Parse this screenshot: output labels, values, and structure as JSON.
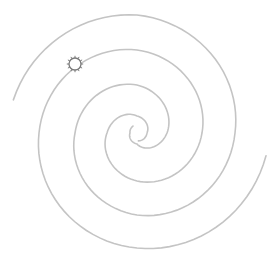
{
  "diagram": {
    "type": "double-arm spiral",
    "center": [
      137,
      133
    ],
    "stroke_color": "#c4c4c4",
    "marker_color": "#7a7a7a",
    "arms": [
      {
        "name": "arm-outer-right",
        "points_deg_r": [
          [
            10,
            131
          ],
          [
            90,
            115
          ],
          [
            180,
            98
          ],
          [
            270,
            83
          ],
          [
            360,
            65
          ],
          [
            450,
            48
          ],
          [
            540,
            30
          ],
          [
            630,
            17
          ],
          [
            720,
            10
          ],
          [
            800,
            8
          ]
        ]
      },
      {
        "name": "arm-outer-left",
        "points_deg_r": [
          [
            195,
            128
          ],
          [
            270,
            118
          ],
          [
            360,
            98
          ],
          [
            450,
            82
          ],
          [
            540,
            62
          ],
          [
            630,
            48
          ],
          [
            720,
            30
          ],
          [
            810,
            11
          ],
          [
            900,
            7
          ],
          [
            960,
            8
          ]
        ]
      }
    ],
    "marker": {
      "icon": "sun-icon",
      "position": [
        75,
        64
      ],
      "radius": 6
    }
  }
}
